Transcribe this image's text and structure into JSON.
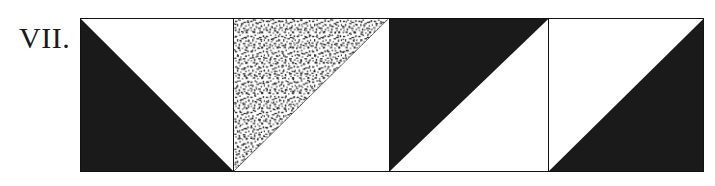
{
  "figure": {
    "label": "VII.",
    "canvas": {
      "width": 715,
      "height": 186,
      "background": "#ffffff"
    },
    "frame": {
      "x": 80,
      "y": 18,
      "width": 624,
      "height": 154,
      "border_color": "#111111",
      "border_width": 1.3
    },
    "ink_color": "#1a1a1a",
    "stipple_color": "#2b2b2b",
    "panel_count": 4,
    "panels": [
      {
        "index": 1,
        "name": "panel-1",
        "fill": "solid-black",
        "fill_color": "#1a1a1a",
        "triangle_position": "lower-left",
        "hypotenuse": "top-left-to-bottom-right",
        "vertices": "top-left, bottom-left, bottom-right",
        "outline": false
      },
      {
        "index": 2,
        "name": "panel-2",
        "fill": "stipple-speckle",
        "fill_color": "#2b2b2b",
        "triangle_position": "upper-left",
        "hypotenuse": "bottom-left-to-top-right",
        "vertices": "top-left, bottom-left, top-right",
        "outline": true
      },
      {
        "index": 3,
        "name": "panel-3",
        "fill": "solid-black",
        "fill_color": "#1a1a1a",
        "triangle_position": "upper-left",
        "hypotenuse": "bottom-left-to-top-right",
        "vertices": "top-left, bottom-left, top-right",
        "outline": false
      },
      {
        "index": 4,
        "name": "panel-4",
        "fill": "solid-black",
        "fill_color": "#1a1a1a",
        "triangle_position": "lower-right",
        "hypotenuse": "bottom-left-to-top-right",
        "vertices": "bottom-left, bottom-right, top-right",
        "outline": false
      }
    ]
  }
}
